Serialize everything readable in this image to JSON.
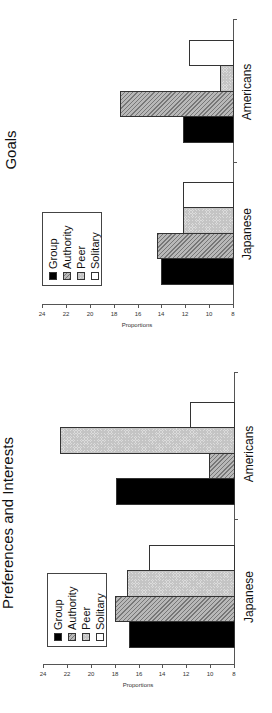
{
  "chart_data": [
    {
      "type": "bar",
      "orientation": "vertical (image rotated 90° counter-clockwise)",
      "title": "Goals",
      "xlabel": "",
      "ylabel": "Proportions",
      "ylim": [
        8,
        24
      ],
      "yticks": [
        8,
        10,
        12,
        14,
        16,
        18,
        20,
        22,
        24
      ],
      "categories": [
        "Japanese",
        "Americans"
      ],
      "series": [
        {
          "name": "Group",
          "values": [
            14.0,
            12.2
          ]
        },
        {
          "name": "Authority",
          "values": [
            14.4,
            17.5
          ]
        },
        {
          "name": "Peer",
          "values": [
            12.2,
            9.1
          ]
        },
        {
          "name": "Solitary",
          "values": [
            12.2,
            11.7
          ]
        }
      ],
      "legend_position": "upper left (inside plot)",
      "grid": false
    },
    {
      "type": "bar",
      "orientation": "vertical (image rotated 90° counter-clockwise)",
      "title": "Preferences and Interests",
      "xlabel": "",
      "ylabel": "Proportions",
      "ylim": [
        8,
        24
      ],
      "yticks": [
        8,
        10,
        12,
        14,
        16,
        18,
        20,
        22,
        24
      ],
      "categories": [
        "Japanese",
        "Americans"
      ],
      "series": [
        {
          "name": "Group",
          "values": [
            16.8,
            17.9
          ]
        },
        {
          "name": "Authority",
          "values": [
            18.0,
            10.1
          ]
        },
        {
          "name": "Peer",
          "values": [
            17.0,
            22.6
          ]
        },
        {
          "name": "Solitary",
          "values": [
            15.1,
            11.7
          ]
        }
      ],
      "legend_position": "upper left (inside plot)",
      "grid": false
    }
  ],
  "charts": [
    {
      "title": "Goals",
      "ylabel": "Proportions",
      "ticks": [
        "8",
        "10",
        "12",
        "14",
        "16",
        "18",
        "20",
        "22",
        "24"
      ],
      "categories": [
        "Japanese",
        "Americans"
      ],
      "legend": [
        "Group",
        "Authority",
        "Peer",
        "Solitary"
      ]
    },
    {
      "title": "Preferences and Interests",
      "ylabel": "Proportions",
      "ticks": [
        "8",
        "10",
        "12",
        "14",
        "16",
        "18",
        "20",
        "22",
        "24"
      ],
      "categories": [
        "Japanese",
        "Americans"
      ],
      "legend": [
        "Group",
        "Authority",
        "Peer",
        "Solitary"
      ]
    }
  ]
}
